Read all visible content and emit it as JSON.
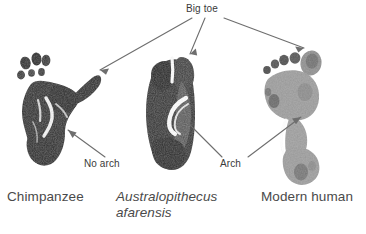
{
  "figure": {
    "background_color": "#ffffff",
    "width": 366,
    "height": 234
  },
  "annotations": {
    "big_toe": "Big toe",
    "no_arch": "No arch",
    "arch": "Arch",
    "label_color": "#3a3a3a",
    "leader_line_color": "#6e6e6e"
  },
  "captions": {
    "chimpanzee": "Chimpanzee",
    "australopithecus_line1": "Australopithecus",
    "australopithecus_line2": "afarensis",
    "modern_human": "Modern human",
    "caption_color": "#4a4a4a"
  },
  "specimens": [
    {
      "id": "chimpanzee",
      "caption": "Chimpanzee",
      "italic_caption": false,
      "print_tone": "dark",
      "print_color": "#3c3c3c",
      "features": [
        "divergent big toe",
        "no arch",
        "separate small toes"
      ]
    },
    {
      "id": "australopithecus-afarensis",
      "caption": "Australopithecus afarensis",
      "italic_caption": true,
      "print_tone": "dark",
      "print_color": "#3a3a3a",
      "features": [
        "adducted big toe",
        "arch",
        "elongated sole"
      ]
    },
    {
      "id": "modern-human",
      "caption": "Modern human",
      "italic_caption": false,
      "print_tone": "light",
      "print_color": "#9a9a9a",
      "features": [
        "big toe aligned",
        "arch",
        "narrow waist",
        "rounded heel"
      ]
    }
  ]
}
